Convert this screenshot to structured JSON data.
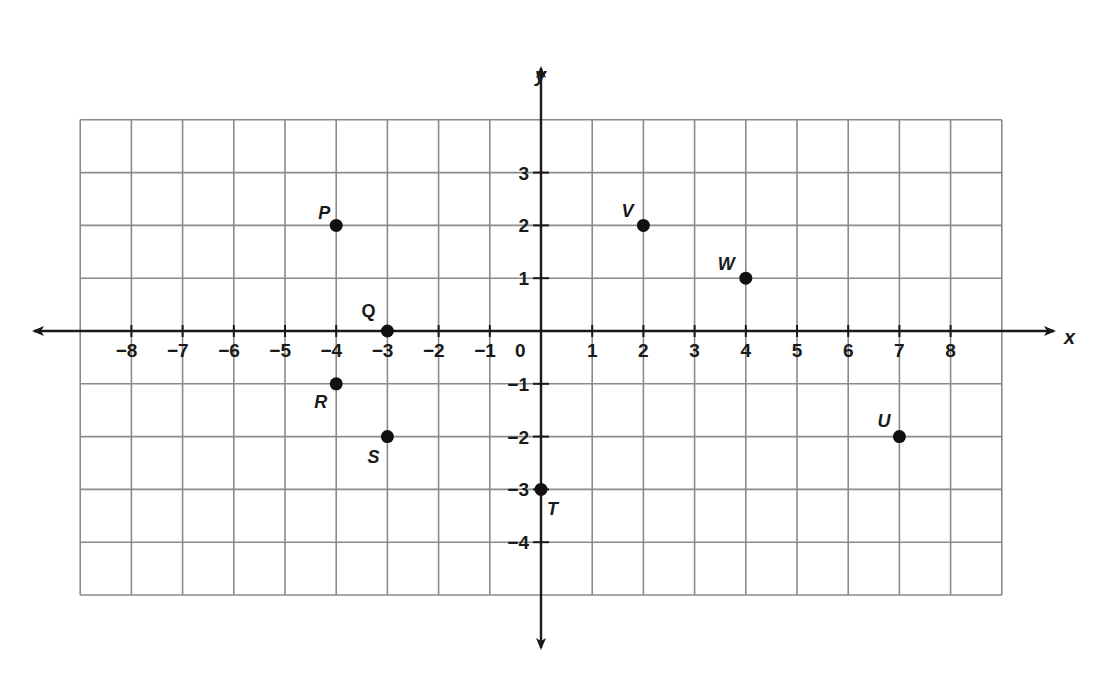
{
  "graph": {
    "axes": {
      "x_label": "x",
      "y_label": "y",
      "origin_label": "0",
      "x_ticks": [
        -8,
        -7,
        -6,
        -5,
        -4,
        -3,
        -2,
        -1,
        1,
        2,
        3,
        4,
        5,
        6,
        7,
        8
      ],
      "y_ticks": [
        3,
        2,
        1,
        -1,
        -2,
        -3,
        -4
      ]
    },
    "grid": {
      "x_min": -9,
      "x_max": 9,
      "y_min": -5,
      "y_max": 4,
      "line_color": "#8a8a8a",
      "axis_color": "#1a1a1a",
      "point_color": "#111111"
    },
    "points": [
      {
        "label": "P",
        "x": -4,
        "y": 2
      },
      {
        "label": "Q",
        "x": -3,
        "y": 0
      },
      {
        "label": "R",
        "x": -4,
        "y": -1
      },
      {
        "label": "S",
        "x": -3,
        "y": -2
      },
      {
        "label": "T",
        "x": 0,
        "y": -3
      },
      {
        "label": "U",
        "x": 7,
        "y": -2
      },
      {
        "label": "V",
        "x": 2,
        "y": 2
      },
      {
        "label": "W",
        "x": 4,
        "y": 1
      }
    ]
  }
}
